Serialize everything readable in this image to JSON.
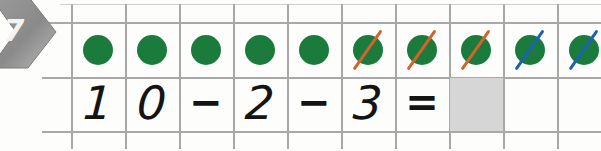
{
  "worksheet": {
    "exercise_number": "7",
    "badge_icon": "arrow-badge-icon",
    "colors": {
      "dot_green": "#1b7b3c",
      "slash_orange": "#d4622a",
      "slash_blue": "#1b63ad",
      "answer_box_grey": "#d6d6d6",
      "grid_line": "#a8a8a8",
      "badge_grey": "#8f8f8f"
    }
  },
  "grid": {
    "columns": 10,
    "rows": 2,
    "cell_width": 54,
    "cell_height": 55,
    "origin_x": 71,
    "origin_y": 22
  },
  "counters": {
    "total": 10,
    "label": "ten green counters in a ten-frame row",
    "items": [
      {
        "index": 1,
        "color": "green",
        "crossed": false,
        "slash_color": ""
      },
      {
        "index": 2,
        "color": "green",
        "crossed": false,
        "slash_color": ""
      },
      {
        "index": 3,
        "color": "green",
        "crossed": false,
        "slash_color": ""
      },
      {
        "index": 4,
        "color": "green",
        "crossed": false,
        "slash_color": ""
      },
      {
        "index": 5,
        "color": "green",
        "crossed": false,
        "slash_color": ""
      },
      {
        "index": 6,
        "color": "green",
        "crossed": true,
        "slash_color": "orange"
      },
      {
        "index": 7,
        "color": "green",
        "crossed": true,
        "slash_color": "orange"
      },
      {
        "index": 8,
        "color": "green",
        "crossed": true,
        "slash_color": "orange"
      },
      {
        "index": 9,
        "color": "green",
        "crossed": true,
        "slash_color": "blue"
      },
      {
        "index": 10,
        "color": "green",
        "crossed": true,
        "slash_color": "blue"
      }
    ],
    "crossed_orange_count": "3",
    "crossed_blue_count": "2",
    "remaining_count": "5"
  },
  "equation": {
    "expression": "10 - 2 - 3 =",
    "cells": [
      {
        "pos": 1,
        "text": "1",
        "kind": "digit",
        "handwritten": true
      },
      {
        "pos": 2,
        "text": "0",
        "kind": "digit",
        "handwritten": true
      },
      {
        "pos": 3,
        "text": "−",
        "kind": "op",
        "handwritten": true
      },
      {
        "pos": 4,
        "text": "2",
        "kind": "digit",
        "handwritten": true
      },
      {
        "pos": 5,
        "text": "−",
        "kind": "op",
        "handwritten": true
      },
      {
        "pos": 6,
        "text": "3",
        "kind": "digit",
        "handwritten": true
      },
      {
        "pos": 7,
        "text": "=",
        "kind": "op",
        "handwritten": true
      },
      {
        "pos": 8,
        "text": "",
        "kind": "answer",
        "handwritten": false
      },
      {
        "pos": 9,
        "text": "",
        "kind": "empty",
        "handwritten": false
      },
      {
        "pos": 10,
        "text": "",
        "kind": "empty",
        "handwritten": false
      }
    ],
    "answer_value": ""
  }
}
